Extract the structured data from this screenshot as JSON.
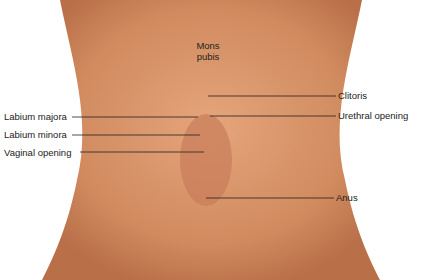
{
  "diagram": {
    "type": "anatomical-labeled-illustration",
    "colors": {
      "skin": "#d9956a",
      "skin_dark": "#b96f48",
      "leader_line": "#222222",
      "background": "#ffffff"
    },
    "center_label": {
      "line1": "Mons",
      "line2": "pubis"
    },
    "left_labels": [
      {
        "text": "Labium majora"
      },
      {
        "text": "Labium minora"
      },
      {
        "text": "Vaginal opening"
      }
    ],
    "right_labels": [
      {
        "text": "Clitoris"
      },
      {
        "text": "Urethral opening"
      },
      {
        "text": "Anus"
      }
    ]
  }
}
